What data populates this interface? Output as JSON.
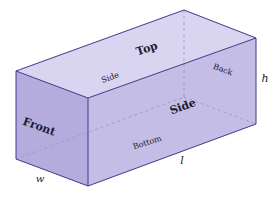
{
  "diagram": {
    "faces": {
      "top": "Top",
      "side_top": "Side",
      "back": "Back",
      "front": "Front",
      "side": "Side",
      "bottom": "Bottom"
    },
    "dimensions": {
      "height": "h",
      "length": "l",
      "width": "w"
    },
    "colors": {
      "top_face": "#d9d5f0",
      "front_face": "#b3acdc",
      "side_face": "#c4bee6",
      "edge": "#3d3a8c",
      "hidden_edge": "#9a93c8"
    }
  }
}
